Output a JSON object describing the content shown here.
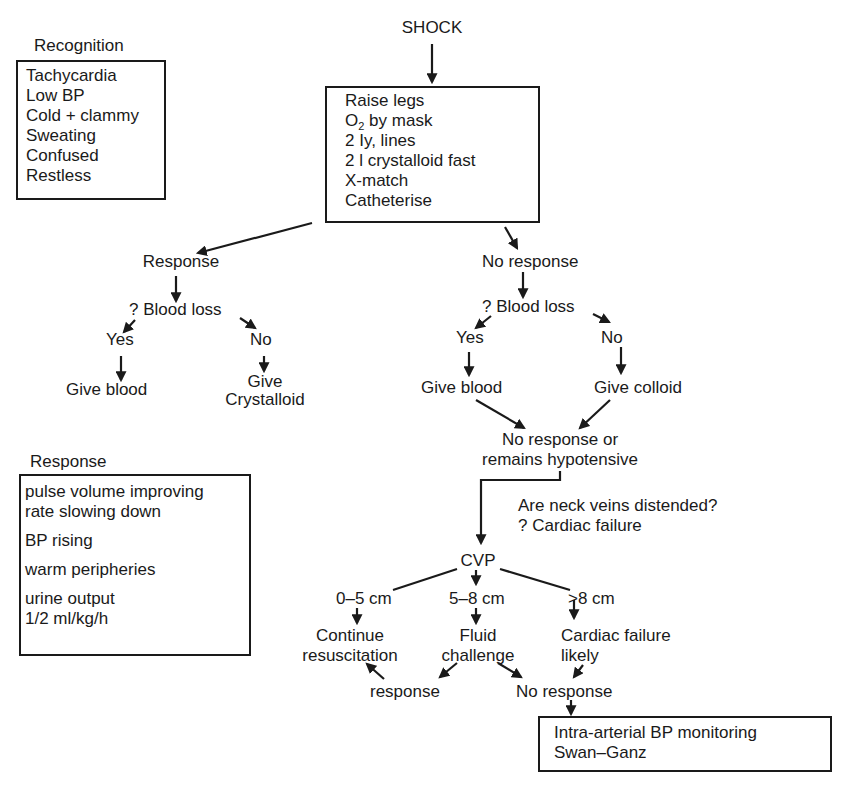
{
  "title": "SHOCK",
  "recognition": {
    "heading": "Recognition",
    "items": [
      "Tachycardia",
      "Low BP",
      "Cold + clammy",
      "Sweating",
      "Confused",
      "Restless"
    ]
  },
  "initial_management": {
    "items": [
      "Raise legs",
      "O",
      "2",
      " by mask",
      "2 Iy, lines",
      "2 l crystalloid fast",
      "X-match",
      "Catheterise"
    ]
  },
  "left_branch": {
    "response": "Response",
    "blood_loss_q": "? Blood loss",
    "yes": "Yes",
    "no": "No",
    "give_blood": "Give blood",
    "give_crystalloid_1": "Give",
    "give_crystalloid_2": "Crystalloid"
  },
  "right_branch": {
    "no_response": "No response",
    "blood_loss_q": "? Blood loss",
    "yes": "Yes",
    "no": "No",
    "give_blood": "Give blood",
    "give_colloid": "Give colloid",
    "outcome_1": "No response or",
    "outcome_2": "remains hypotensive"
  },
  "neck_veins": {
    "line1": "Are neck veins distended?",
    "line2": "? Cardiac failure"
  },
  "response_box": {
    "heading": "Response",
    "groups": [
      [
        "pulse volume improving",
        "rate slowing down"
      ],
      [
        "BP rising"
      ],
      [
        "warm peripheries"
      ],
      [
        "urine output",
        "1/2 ml/kg/h"
      ]
    ]
  },
  "cvp": {
    "label": "CVP",
    "low": "0–5 cm",
    "mid": "5–8 cm",
    "high": ">8 cm",
    "continue_1": "Continue",
    "continue_2": "resuscitation",
    "fluid_1": "Fluid",
    "fluid_2": "challenge",
    "cardiac_1": "Cardiac failure",
    "cardiac_2": "likely",
    "response": "response",
    "no_response": "No response"
  },
  "final_box": {
    "items": [
      "Intra-arterial BP monitoring",
      "Swan–Ganz"
    ]
  }
}
